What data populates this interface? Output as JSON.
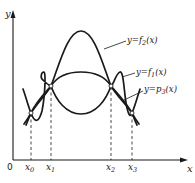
{
  "diagram": {
    "type": "function-interpolation-plot",
    "axes": {
      "x_label": "x",
      "y_label": "y",
      "origin_label": "0"
    },
    "nodes": [
      {
        "name": "x",
        "sub": "0"
      },
      {
        "name": "x",
        "sub": "1"
      },
      {
        "name": "x",
        "sub": "2"
      },
      {
        "name": "x",
        "sub": "3"
      }
    ],
    "curves": [
      {
        "id": "f2",
        "label_prefix": "y=f",
        "label_sub": "2",
        "label_suffix": "(x)",
        "description": "tall arch peaking between x1 and x2, passing through all four nodes"
      },
      {
        "id": "f1",
        "label_prefix": "y=f",
        "label_sub": "1",
        "label_suffix": "(x)",
        "description": "oscillating curve through all four nodes"
      },
      {
        "id": "p3",
        "label_prefix": "y=p",
        "label_sub": "3",
        "label_suffix": "(x)",
        "description": "cubic interpolating polynomial through the four nodes"
      }
    ],
    "colors": {
      "ink": "#1a1a1a",
      "background": "#ffffff",
      "node_fill": "#ffffff"
    }
  }
}
